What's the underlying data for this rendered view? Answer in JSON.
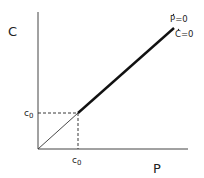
{
  "diagram": {
    "axes": {
      "y_label": "C",
      "x_label": "P"
    },
    "point": {
      "y_tick_label": "c",
      "y_tick_sub": "0",
      "x_tick_label": "c",
      "x_tick_sub": "0"
    },
    "curve_labels": {
      "p_dot": "P",
      "p_dot_eq": "=0",
      "c_dot": "C",
      "c_dot_eq": "=0"
    },
    "colors": {
      "line": "#111111",
      "axis": "#333333"
    }
  }
}
